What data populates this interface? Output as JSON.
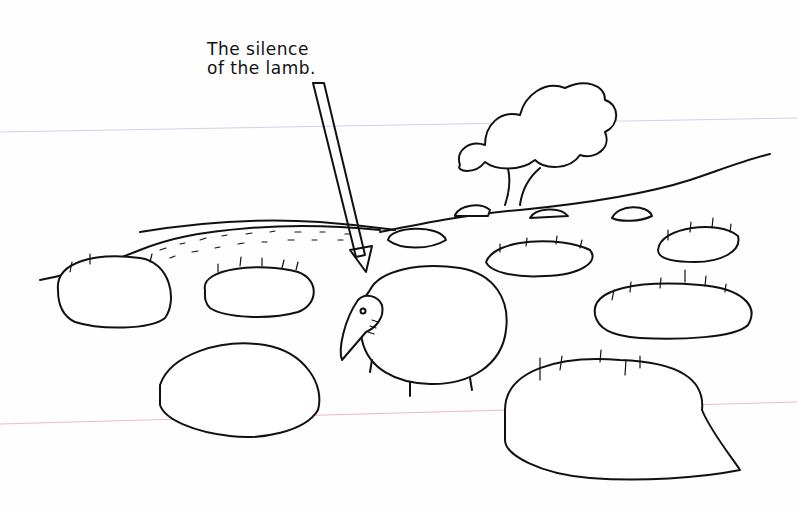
{
  "cartoon": {
    "caption_lines": [
      "The silence",
      "of the lamb."
    ],
    "subject": "Flock of sheep lying down in a field, one standing sheep with a wolf-like snout singled out by an arrow",
    "colors": {
      "ink": "#111111",
      "paper": "#fefefe",
      "rule_blue": "#c9d4ec",
      "rule_red": "#f0b8c4"
    }
  }
}
